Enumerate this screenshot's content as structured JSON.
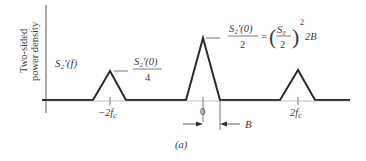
{
  "figure": {
    "ylabel_line1": "Two-sided",
    "ylabel_line2": "power density",
    "curve_label": "S₂′(f)",
    "caption": "(a)"
  },
  "annotations": {
    "side_peak_numer": "S₂′(0)",
    "side_peak_denom": "4",
    "center_peak_numer": "S₂′(0)",
    "center_peak_denom": "2",
    "equals": "=",
    "s0_numer": "S₀",
    "s0_denom": "2",
    "exponent": "2",
    "factor": "2B",
    "bandwidth_label": "B"
  },
  "x_ticks": [
    {
      "label": "−2f",
      "sub": "c"
    },
    {
      "label": "0",
      "sub": ""
    },
    {
      "label": "2f",
      "sub": "c"
    }
  ],
  "colors": {
    "line": "#2a2a2a",
    "text": "#3a3a3a"
  }
}
